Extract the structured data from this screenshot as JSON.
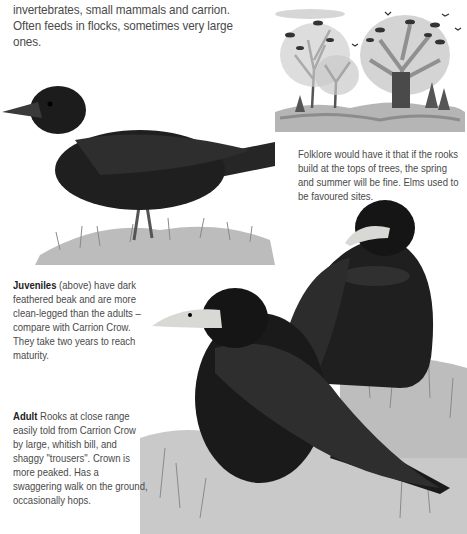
{
  "page": {
    "intro_text": "invertebrates, small mammals and carrion. Often feeds in flocks, sometimes very large ones."
  },
  "captions": {
    "folklore": "Folklore would have it that if the rooks build at the tops of trees, the spring and summer will be fine. Elms used to be favoured sites.",
    "juveniles": {
      "lead": "Juveniles",
      "text": " (above) have dark feathered beak and are more clean-legged than the adults – compare with Carrion Crow. They take two years to reach maturity."
    },
    "adult": {
      "lead": "Adult",
      "text": " Rooks at close range easily told from Carrion Crow by large, whitish bill, and shaggy \"trousers\". Crown is more peaked. Has a swaggering walk on the ground, occasionally hops."
    }
  },
  "illustrations": {
    "rookery_scene": "rookery-trees-illustration",
    "juvenile_rook": "juvenile-rook-illustration",
    "adult_rooks": "adult-rooks-illustration"
  },
  "colors": {
    "text": "#4a4a4a",
    "bird_black": "#1a1a1a",
    "bill_pale": "#d8d8d4",
    "grass": "#8a8a8a"
  }
}
